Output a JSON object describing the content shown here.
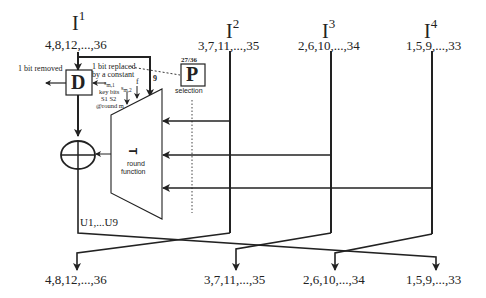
{
  "inputs": [
    {
      "name": "I",
      "sup": "1",
      "bits": "4,8,12,...,36"
    },
    {
      "name": "I",
      "sup": "2",
      "bits": "3,7,11,...,35"
    },
    {
      "name": "I",
      "sup": "3",
      "bits": "2,6,10,...,34"
    },
    {
      "name": "I",
      "sup": "4",
      "bits": "1,5,9,...,33"
    }
  ],
  "outputs": [
    {
      "bits": "4,8,12,...,36"
    },
    {
      "bits": "3,7,11,...,35"
    },
    {
      "bits": "2,6,10,...,34"
    },
    {
      "bits": "1,5,9,...,33"
    }
  ],
  "blocks": {
    "d_box": {
      "letter": "D",
      "left_note": "1 bit removed"
    },
    "p_box": {
      "letter": "P",
      "ratio": "27/36",
      "caption": "selection"
    },
    "round_function": {
      "symbol": "T",
      "caption_line1": "round",
      "caption_line2": "function"
    },
    "xor": {
      "symbol": "⊕"
    }
  },
  "annotations": {
    "replaced_line1": "1 bit replaced",
    "replaced_line2": "by a constant",
    "sm1": "s",
    "sm1_sub": "m,1",
    "sm2": "s",
    "sm2_sub": "m,2",
    "f": "f",
    "nine": "9",
    "key_bits_line1": "key bits",
    "key_bits_line2": "S1 S2",
    "key_bits_line3": "@round m",
    "u_range": "U1,...U9"
  }
}
